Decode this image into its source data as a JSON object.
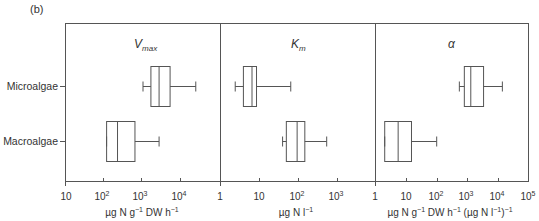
{
  "figure_label": "(b)",
  "chart_data": [
    {
      "type": "boxplot",
      "title": "Vmax",
      "title_main": "V",
      "title_sub": "max",
      "xscale": "log",
      "xlim": [
        10,
        100000
      ],
      "x_ticks": [
        "10",
        "10^2",
        "10^3",
        "10^4",
        "1"
      ],
      "xlabel": "µg N g⁻¹ DW h⁻¹",
      "categories": [
        "Microalgae",
        "Macroalgae"
      ],
      "series": [
        {
          "name": "Microalgae",
          "whisker_low": 1000,
          "q1": 1600,
          "median": 2600,
          "q3": 5000,
          "whisker_high": 23000
        },
        {
          "name": "Macroalgae",
          "whisker_low": 115,
          "q1": 115,
          "median": 220,
          "q3": 620,
          "whisker_high": 2600
        }
      ]
    },
    {
      "type": "boxplot",
      "title": "Km",
      "title_main": "K",
      "title_sub": "m",
      "xscale": "log",
      "xlim": [
        1,
        10000
      ],
      "x_ticks": [
        "1",
        "10",
        "10^2",
        "10^3",
        "1"
      ],
      "xlabel": "µg N l⁻¹",
      "categories": [
        "Microalgae",
        "Macroalgae"
      ],
      "series": [
        {
          "name": "Microalgae",
          "whisker_low": 2.4,
          "q1": 3.9,
          "median": 6.5,
          "q3": 8.5,
          "whisker_high": 65
        },
        {
          "name": "Macroalgae",
          "whisker_low": 40,
          "q1": 50,
          "median": 95,
          "q3": 150,
          "whisker_high": 550
        }
      ]
    },
    {
      "type": "boxplot",
      "title": "α",
      "title_main": "α",
      "title_sub": "",
      "xscale": "log",
      "xlim": [
        1,
        100000
      ],
      "x_ticks": [
        "1",
        "10",
        "10^2",
        "10^3",
        "10^4",
        "10^5"
      ],
      "xlabel": "µg N g⁻¹ DW h⁻¹ (µg N l⁻¹)⁻¹",
      "categories": [
        "Microalgae",
        "Macroalgae"
      ],
      "series": [
        {
          "name": "Microalgae",
          "whisker_low": 550,
          "q1": 800,
          "median": 1300,
          "q3": 3400,
          "whisker_high": 14000
        },
        {
          "name": "Macroalgae",
          "whisker_low": 2,
          "q1": 2,
          "median": 5.5,
          "q3": 15,
          "whisker_high": 100
        }
      ]
    }
  ],
  "y_labels": [
    "Microalgae",
    "Macroalgae"
  ],
  "ticks": {
    "p1": [
      "10",
      "10",
      "10",
      "10",
      "1"
    ],
    "p1_exp": [
      "",
      "2",
      "3",
      "4",
      ""
    ],
    "p2": [
      "10",
      "10",
      "10"
    ],
    "p2_exp": [
      "",
      "2",
      "3"
    ],
    "p3": [
      "10",
      "10",
      "10",
      "10",
      "10"
    ],
    "p3_exp": [
      "",
      "2",
      "3",
      "4",
      "5"
    ],
    "one": "1"
  },
  "xlabels": {
    "p1": [
      "µg N g",
      "−1",
      " DW h",
      "−1"
    ],
    "p2": [
      "µg N l",
      "−1"
    ],
    "p3": [
      "µg N g",
      "−1",
      " DW h",
      "−1",
      " (µg N l",
      "−1",
      ")",
      "−1"
    ]
  },
  "colors": {
    "axis": "#555555",
    "box": "#555555",
    "text": "#333333",
    "background": "#ffffff"
  }
}
